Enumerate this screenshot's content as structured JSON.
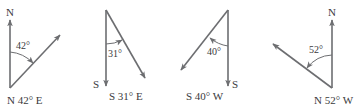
{
  "colors": {
    "line": "#6d6e71",
    "text": "#3a3a3c",
    "background": "#ffffff"
  },
  "figures": [
    {
      "reference": "N",
      "angle_label": "42°",
      "angle_deg": 42,
      "turn": "E",
      "bearing": "N 42° E"
    },
    {
      "reference": "S",
      "angle_label": "31°",
      "angle_deg": 31,
      "turn": "E",
      "bearing": "S 31° E"
    },
    {
      "reference": "S",
      "angle_label": "40°",
      "angle_deg": 40,
      "turn": "W",
      "bearing": "S 40° W"
    },
    {
      "reference": "N",
      "angle_label": "52°",
      "angle_deg": 52,
      "turn": "W",
      "bearing": "N 52° W"
    }
  ]
}
